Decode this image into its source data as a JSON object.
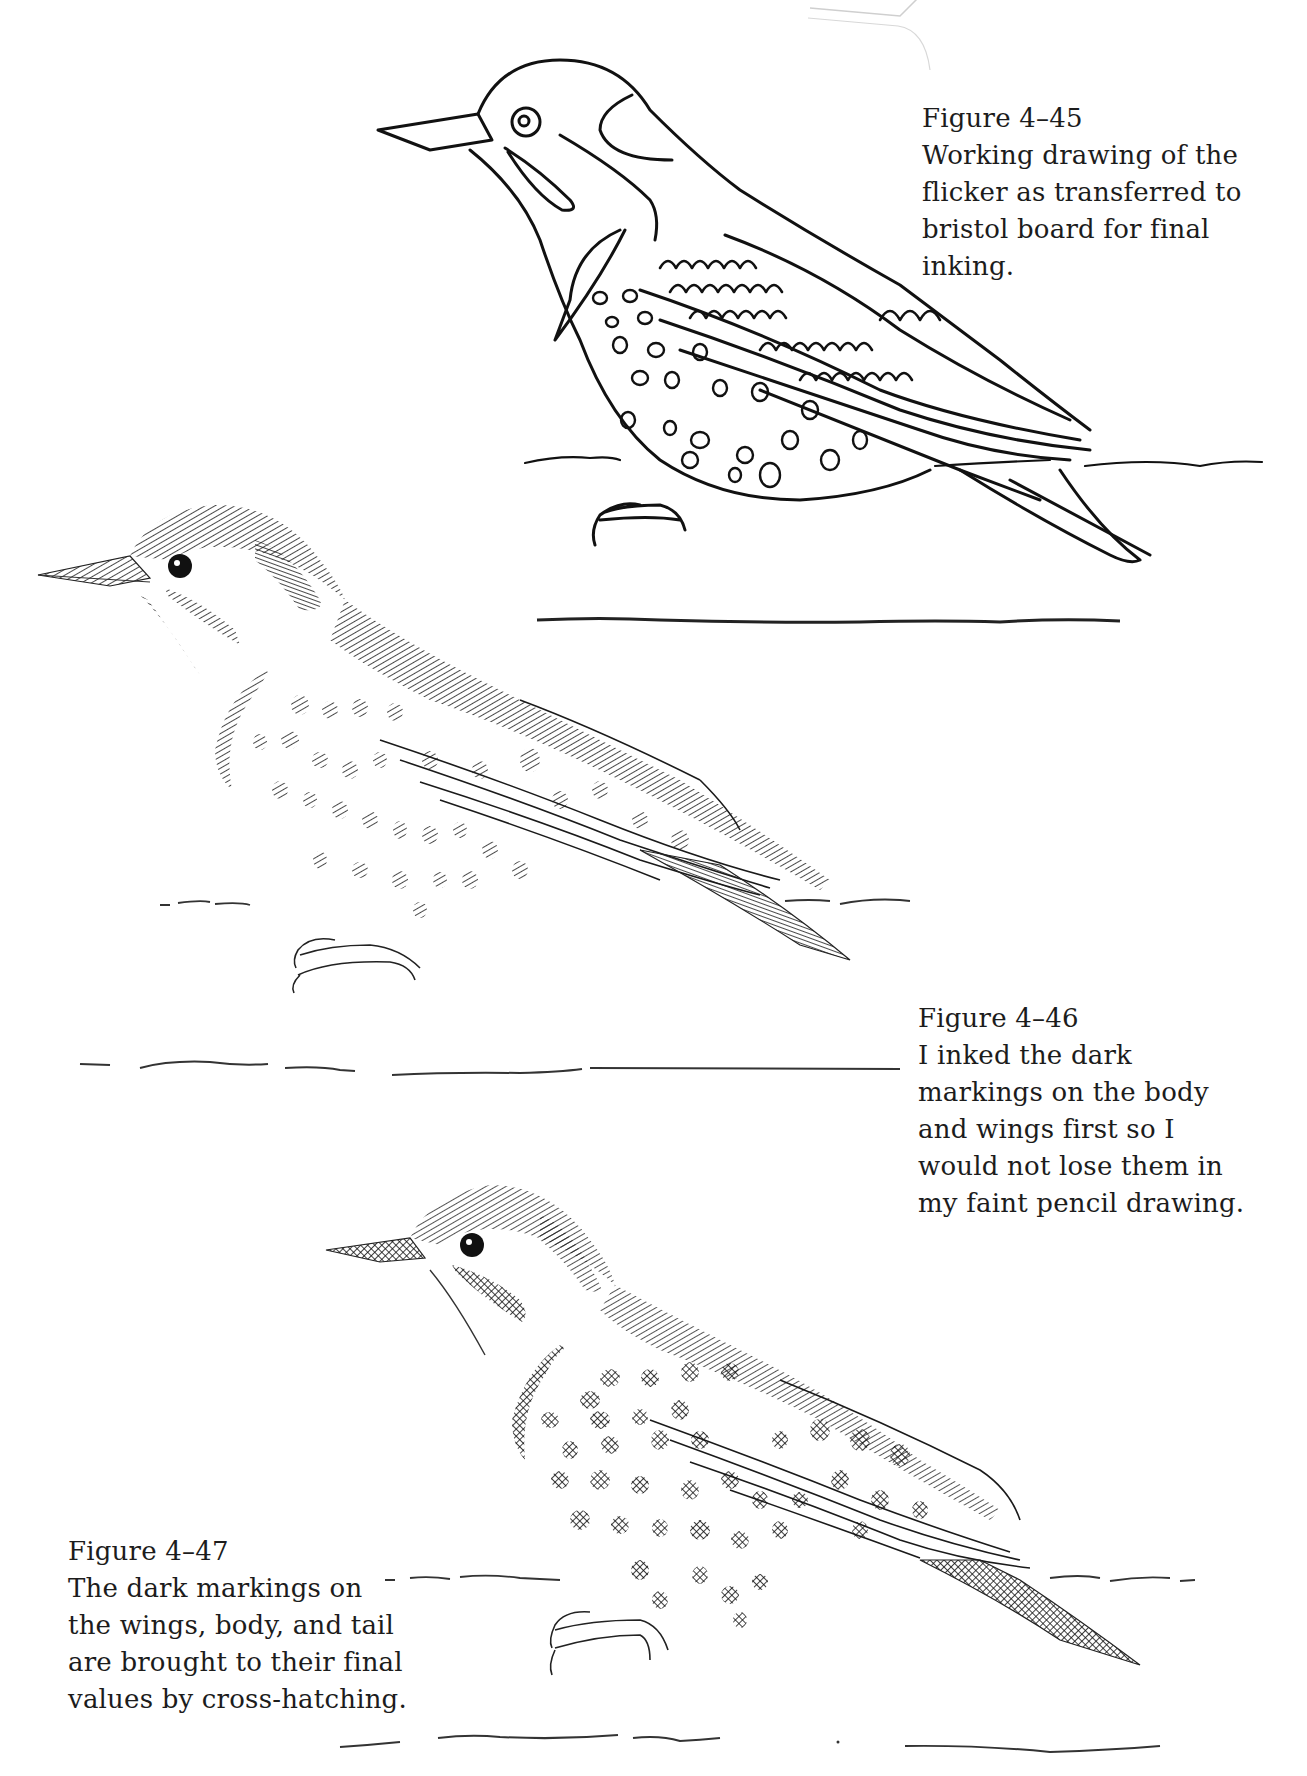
{
  "page": {
    "background": "#ffffff",
    "ink_color": "#1a1a1a"
  },
  "figures": [
    {
      "id": "fig-4-45",
      "title": "Figure 4–45",
      "caption_lines": [
        "Working drawing of the",
        "flicker as transferred to",
        "bristol board for final",
        "inking."
      ],
      "illustration": "Outline working drawing of a flicker perched on a branch, with open-circle spots"
    },
    {
      "id": "fig-4-46",
      "title": "Figure 4–46",
      "caption_lines": [
        "I inked the dark",
        "markings on the body",
        "and wings first so I",
        "would not lose them in",
        "my faint pencil drawing."
      ],
      "illustration": "Partially inked flicker with hatched dark markings on body and wings"
    },
    {
      "id": "fig-4-47",
      "title": "Figure 4–47",
      "caption_lines": [
        "The dark markings on",
        "the wings, body, and tail",
        "are brought to their final",
        "values by cross-hatching."
      ],
      "illustration": "Finished flicker with cross-hatched dark markings, mustache, bib and tail"
    }
  ]
}
